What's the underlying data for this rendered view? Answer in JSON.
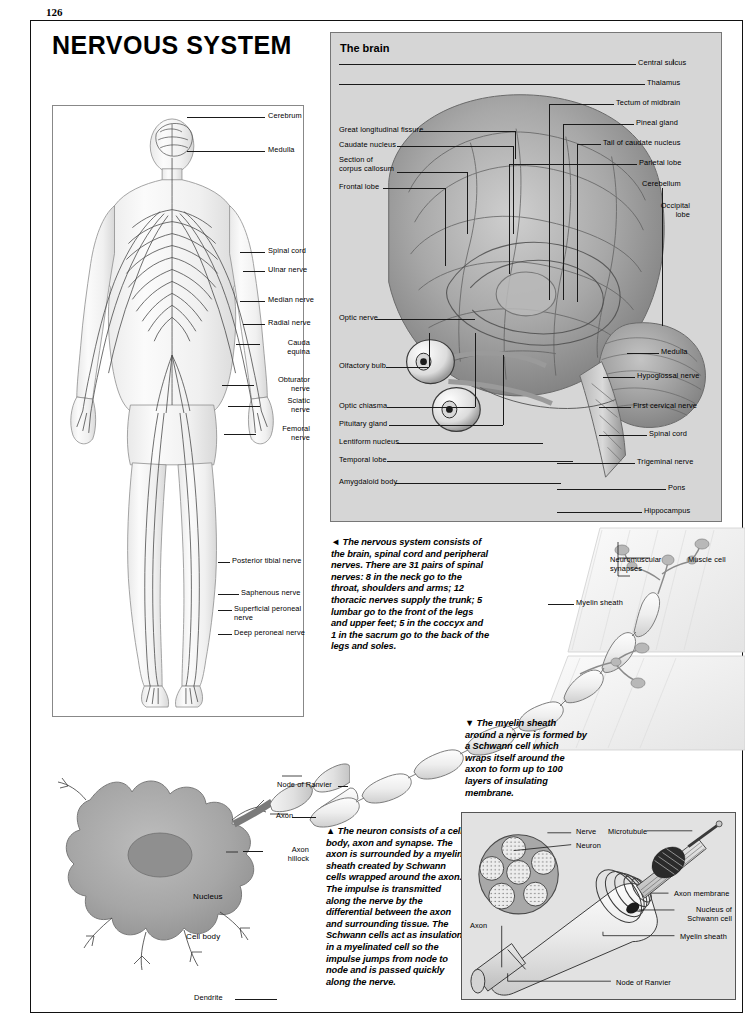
{
  "page": {
    "number": "126",
    "title": "NERVOUS SYSTEM"
  },
  "brain_panel": {
    "header": "The brain",
    "labels_right": [
      "Central sulcus",
      "Thalamus",
      "Tectum of midbrain",
      "Pineal gland",
      "Tail of caudate nucleus",
      "Parietal lobe",
      "Cerebellum",
      "Occipital\nlobe"
    ],
    "labels_left_upper": [
      "Great longitudinal fissure",
      "Caudate nucleus",
      "Section of\ncorpus callosum",
      "Frontal lobe"
    ],
    "labels_left_lower": [
      "Optic nerve",
      "Olfactory bulb",
      "Optic chiasma",
      "Pituitary gland",
      "Lentiform nucleus",
      "Temporal lobe",
      "Amygdaloid body"
    ],
    "labels_right_lower": [
      "Medulla",
      "Hypoglossal nerve",
      "First cervical nerve",
      "Spinal cord",
      "Trigeminal nerve",
      "Pons",
      "Hippocampus"
    ]
  },
  "body_panel": {
    "labels": [
      "Cerebrum",
      "Medulla",
      "Spinal cord",
      "Ulnar nerve",
      "Median nerve",
      "Radial nerve",
      "Cauda\nequina",
      "Obturator\nnerve",
      "Sciatic\nnerve",
      "Femoral\nnerve",
      "Posterior tibial nerve",
      "Saphenous nerve",
      "Superficial peroneal\nnerve",
      "Deep peroneal nerve"
    ]
  },
  "captions": {
    "nervous_system": "◄ The nervous system consists of the brain, spinal cord and peripheral nerves. There are 31 pairs of spinal nerves: 8 in the neck go to the throat, shoulders and arms; 12 thoracic nerves supply the trunk; 5 lumbar go to the front of the legs and upper feet; 5 in the coccyx and 1 in the sacrum go to the back of the legs and soles.",
    "myelin": "▼ The myelin sheath around a nerve is formed by a Schwann cell which wraps itself around the axon to form up to 100 layers of insulating membrane.",
    "neuron": "▲ The neuron consists of a cell body, axon and synapse. The axon is surrounded by a myelin sheath created by Schwann cells wrapped around the axon. The impulse is transmitted along the nerve by the differential between the axon and surrounding tissue. The Schwann cells act as insulation in a myelinated cell so the impulse jumps from node to node and is passed quickly along the nerve."
  },
  "nerve_muscle_diagram": {
    "labels": [
      "Neuromuscular\nsynapses",
      "Muscle cell",
      "Myelin sheath"
    ]
  },
  "neuron_diagram": {
    "labels": [
      "Node of Ranvier",
      "Axon",
      "Axon\nhillock",
      "Nucleus",
      "Cell body",
      "Dendrite"
    ]
  },
  "schwann_panel": {
    "labels": [
      "Nerve",
      "Neuron",
      "Microtubule",
      "Axon membrane",
      "Nucleus of\nSchwann cell",
      "Myelin sheath",
      "Axon",
      "Node of Ranvier"
    ]
  },
  "colors": {
    "panel_gray": "#d6d6d6",
    "inset_gray": "#e2e2e2",
    "ink": "#1a1a1a",
    "cell_gray": "#9c9c9c",
    "nucleus_gray": "#8a8a8a"
  }
}
